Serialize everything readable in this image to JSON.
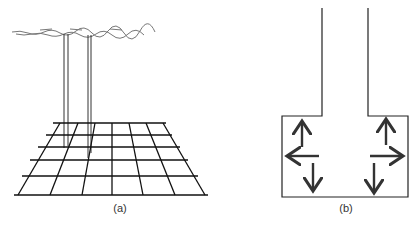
{
  "figure": {
    "panels": [
      {
        "id": "a",
        "caption": "(a)",
        "description": "Perspective grid plane with two vertical posts rising to a wavy cloud-like strip",
        "grid": {
          "rows": 5,
          "cols": 7
        }
      },
      {
        "id": "b",
        "caption": "(b)",
        "description": "Cross-section of a channel opening into a box with outward arrows",
        "arrows": [
          "up-left",
          "left",
          "down-left",
          "up-right",
          "right",
          "down-right"
        ]
      }
    ],
    "colors": {
      "stroke": "#222222",
      "arrow": "#333333",
      "cloud": "#777777",
      "background": "#ffffff"
    }
  }
}
